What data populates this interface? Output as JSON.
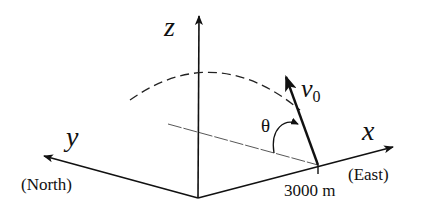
{
  "diagram": {
    "type": "3d-coordinate-projectile",
    "axes": {
      "z": {
        "label": "z"
      },
      "y": {
        "label": "y",
        "direction": "(North)"
      },
      "x": {
        "label": "x",
        "direction": "(East)"
      }
    },
    "launch_point": {
      "distance_label": "3000 m"
    },
    "velocity": {
      "symbol": "v",
      "subscript": "0"
    },
    "angle": {
      "symbol": "θ"
    },
    "colors": {
      "ink": "#111111",
      "dashed": "#333333",
      "background": "#ffffff"
    }
  }
}
